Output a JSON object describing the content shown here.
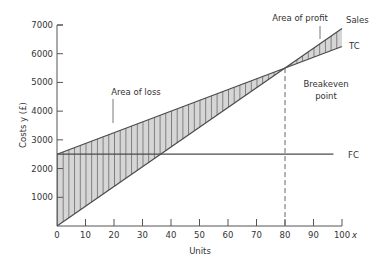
{
  "chart_data": {
    "type": "line",
    "title": "",
    "xlabel": "Units",
    "x_axis_symbol": "x",
    "ylabel": "Costs y (£)",
    "xlim": [
      0,
      100
    ],
    "ylim": [
      0,
      7000
    ],
    "grid": false,
    "x_ticks": [
      0,
      10,
      20,
      30,
      40,
      50,
      60,
      70,
      80,
      90,
      100
    ],
    "y_ticks": [
      1000,
      2000,
      3000,
      4000,
      5000,
      6000,
      7000
    ],
    "x_tick_labels": [
      "0",
      "10",
      "20",
      "30",
      "40",
      "50",
      "60",
      "70",
      "80",
      "90",
      "100"
    ],
    "y_tick_labels": [
      "1000",
      "2000",
      "3000",
      "4000",
      "5000",
      "6000",
      "7000"
    ],
    "series": [
      {
        "name": "Sales",
        "x": [
          0,
          100
        ],
        "values": [
          0,
          6875
        ]
      },
      {
        "name": "TC",
        "x": [
          0,
          100
        ],
        "values": [
          2500,
          6250
        ]
      },
      {
        "name": "FC",
        "x": [
          0,
          100
        ],
        "values": [
          2500,
          2500
        ]
      }
    ],
    "breakeven": {
      "x": 80,
      "y": 5500,
      "style": "dashed vertical line"
    },
    "shaded_regions": [
      {
        "name": "Area of loss",
        "between": [
          "TC",
          "Sales"
        ],
        "x_range": [
          0,
          80
        ],
        "fill": "hatched"
      },
      {
        "name": "Area of profit",
        "between": [
          "Sales",
          "TC"
        ],
        "x_range": [
          80,
          100
        ],
        "fill": "hatched"
      }
    ],
    "annotations": [
      {
        "text": "Area of loss",
        "x": 30,
        "y": 4400
      },
      {
        "text": "Area of profit",
        "x": 88,
        "y": 7000
      },
      {
        "text": "Breakeven",
        "x": 92,
        "y": 5000
      },
      {
        "text": "point",
        "x": 92,
        "y": 4500
      }
    ]
  },
  "labels": {
    "ylabel": "Costs y (£)",
    "xlabel": "Units",
    "x_symbol": "x",
    "area_loss": "Area of loss",
    "area_profit": "Area of profit",
    "breakeven_line1": "Breakeven",
    "breakeven_line2": "point",
    "sales": "Sales",
    "tc": "TC",
    "fc": "FC"
  },
  "colors": {
    "line": "#4a4a4a",
    "hatch_fill": "#d4d4d4",
    "hatch_line": "#555555",
    "axis": "#555555"
  }
}
